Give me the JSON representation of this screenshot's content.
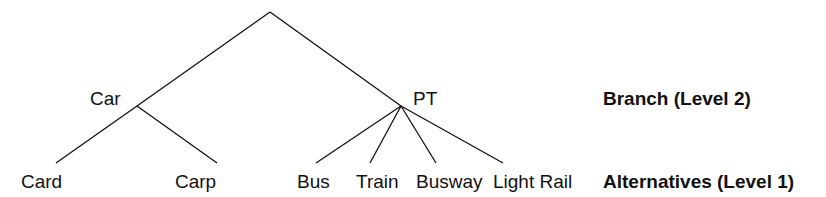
{
  "diagram": {
    "type": "nested-logit-tree",
    "root": {
      "label": ""
    },
    "branches": [
      {
        "label": "Car",
        "alternatives": [
          "Card",
          "Carp"
        ]
      },
      {
        "label": "PT",
        "alternatives": [
          "Bus",
          "Train",
          "Busway",
          "Light Rail"
        ]
      }
    ],
    "levels": {
      "branch": "Branch (Level 2)",
      "alternatives": "Alternatives (Level 1)"
    },
    "line_color": "#111111"
  }
}
